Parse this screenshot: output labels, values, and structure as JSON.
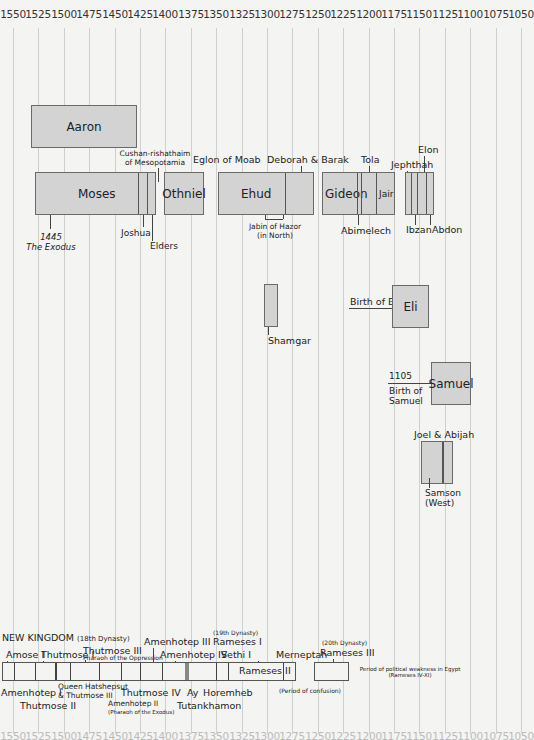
{
  "axis": {
    "years": [
      "1550",
      "1525",
      "1500",
      "1475",
      "1450",
      "1425",
      "1400",
      "1375",
      "1350",
      "1325",
      "1300",
      "1275",
      "1250",
      "1225",
      "1200",
      "1175",
      "1150",
      "1125",
      "1100",
      "1075",
      "1050"
    ]
  },
  "judges": {
    "aaron": "Aaron",
    "moses": "Moses",
    "cushan": "Cushan-rishathaim\nof Mesopotamia",
    "othniel": "Othniel",
    "eglon": "Eglon of Moab",
    "ehud": "Ehud",
    "deborah": "Deborah & Barak",
    "jabin": "Jabin of Hazor\n(in North)",
    "gideon": "Gideon",
    "tola": "Tola",
    "jair": "Jair",
    "abimelech": "Abimelech",
    "jephthah": "Jephthah",
    "elon": "Elon",
    "ibzan": "Ibzan",
    "abdon": "Abdon",
    "exodus_year": "1445",
    "exodus": "The Exodus",
    "joshua": "Joshua",
    "elders": "Elders",
    "shamgar": "Shamgar",
    "birth_of_eli": "Birth of Eli",
    "eli": "Eli",
    "samuel_year": "1105",
    "birth_of_samuel": "Birth of\nSamuel",
    "samuel": "Samuel",
    "joel_abijah": "Joel & Abijah",
    "samson": "Samson\n(West)"
  },
  "egypt": {
    "new_kingdom": "NEW KINGDOM",
    "dynasty18": "(18th Dynasty)",
    "amose1": "Amose I",
    "thutmose1": "Thutmose I",
    "thutmose3": "Thutmose III",
    "thutmose3_note": "Pharaoh of the Oppression",
    "amenhotep3": "Amenhotep III",
    "amenhotep4": "Amenhotep IV",
    "dynasty19": "(19th Dynasty)",
    "rameses1": "Rameses I",
    "sethi1": "Sethi I",
    "rameses2": "Rameses II",
    "merneptah": "Merneptah",
    "dynasty20": "(20th Dynasty)",
    "rameses3": "Rameses III",
    "weakness": "Period of political weakness in Egypt\n(Rameses IV-XI)",
    "amenhotep1": "Amenhotep I",
    "thutmose2": "Thutmose II",
    "hatshepsut": "Queen Hatshepsut\n& Thutmose III",
    "thutmose4": "Thutmose IV",
    "amenhotep2": "Amenhotep II",
    "amenhotep2_note": "(Pharaoh of the Exodus)",
    "ay": "Ay",
    "tutankhamon": "Tutankhamon",
    "horemheb": "Horemheb",
    "confusion": "(Period of confusion)"
  }
}
